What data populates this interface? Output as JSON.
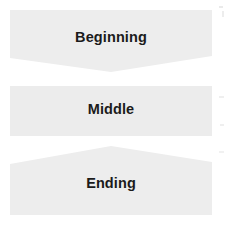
{
  "diagram": {
    "type": "vertical-process-flow",
    "background_color": "#ffffff",
    "shape_fill": "#ededed",
    "label_color": "#1b1b1b",
    "stages": [
      {
        "id": "beginning",
        "label": "Beginning",
        "shape": "chevron-down",
        "points": "10,10 212,10 212,56 111,72 10,58",
        "fill": "#ededed"
      },
      {
        "id": "middle",
        "label": "Middle",
        "shape": "rectangle",
        "points": "10,86 212,86 212,136 10,136",
        "fill": "#ececec"
      },
      {
        "id": "ending",
        "label": "Ending",
        "shape": "chevron-up",
        "points": "111,146 212,162 212,215 10,215 10,164",
        "fill": "#ededed"
      }
    ]
  }
}
